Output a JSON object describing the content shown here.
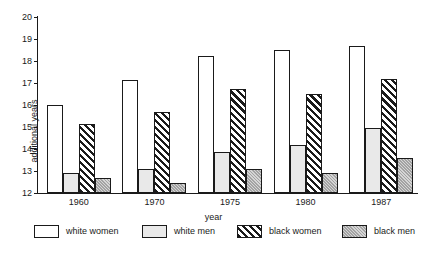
{
  "chart_data": {
    "type": "bar",
    "title": "",
    "xlabel": "year",
    "ylabel": "additional years",
    "categories": [
      "1960",
      "1970",
      "1975",
      "1980",
      "1987"
    ],
    "ylim": [
      12,
      20
    ],
    "yticks": [
      12,
      13,
      14,
      15,
      16,
      17,
      18,
      19,
      20
    ],
    "ytick_labels": [
      "12",
      "13",
      "14",
      "15",
      "16",
      "17",
      "18",
      "19",
      "20"
    ],
    "grid": false,
    "legend_position": "bottom",
    "series": [
      {
        "name": "white women",
        "fill": "solid-white",
        "color": "#ffffff",
        "values": [
          16.0,
          17.15,
          18.25,
          18.5,
          18.7
        ]
      },
      {
        "name": "white men",
        "fill": "solid-light-gray",
        "color": "#e9e9e9",
        "values": [
          12.9,
          13.1,
          13.85,
          14.2,
          14.95
        ]
      },
      {
        "name": "black women",
        "fill": "diagonal-hatch",
        "color": "#1a1a1a",
        "values": [
          15.15,
          15.7,
          16.75,
          16.5,
          17.2
        ]
      },
      {
        "name": "black men",
        "fill": "solid-medium-gray",
        "color": "#a3a3a3",
        "values": [
          12.7,
          12.45,
          13.1,
          12.9,
          13.6
        ]
      }
    ]
  },
  "axes": {
    "ylabel": "additional years",
    "xlabel": "year"
  },
  "legend": {
    "items": [
      {
        "label": "white women",
        "swatch": "sw-white-women"
      },
      {
        "label": "white men",
        "swatch": "sw-white-men"
      },
      {
        "label": "black women",
        "swatch": "sw-black-women"
      },
      {
        "label": "black men",
        "swatch": "sw-black-men"
      }
    ]
  }
}
